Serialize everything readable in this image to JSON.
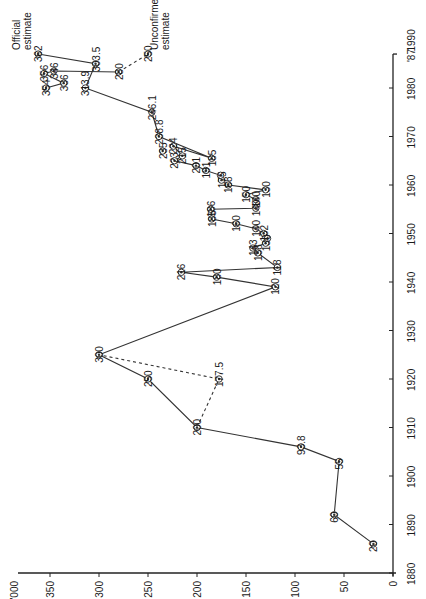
{
  "chart_data": {
    "type": "line",
    "orientation": "rotated-90-ccw",
    "title": "",
    "xlabel": "",
    "ylabel": "'000",
    "x_axis": {
      "min": 1880,
      "max": 1990,
      "ticks": [
        1880,
        1890,
        1900,
        1910,
        1920,
        1930,
        1940,
        1950,
        1960,
        1970,
        1980,
        1990
      ],
      "extra_tick_label": "'87",
      "extra_tick_value": 1987
    },
    "y_axis": {
      "min": 0,
      "max": 370,
      "ticks": [
        0,
        50,
        100,
        150,
        200,
        250,
        300,
        350
      ],
      "unit_label": "'000"
    },
    "grid": false,
    "annotations": [
      {
        "text": "Official estimate",
        "x": 1987,
        "y": 362
      },
      {
        "text": "Unconfirmed estimate",
        "x": 1987,
        "y": 250
      }
    ],
    "series": [
      {
        "name": "Main series",
        "style": "solid",
        "points": [
          {
            "x": 1886,
            "y": 20,
            "label": "20"
          },
          {
            "x": 1892,
            "y": 60,
            "label": "60"
          },
          {
            "x": 1903,
            "y": 55,
            "label": "55"
          },
          {
            "x": 1906,
            "y": 93.8,
            "label": "93.8"
          },
          {
            "x": 1910,
            "y": 200,
            "label": "200"
          },
          {
            "x": 1920,
            "y": 250,
            "label": "250"
          },
          {
            "x": 1925,
            "y": 300,
            "label": "300"
          },
          {
            "x": 1939,
            "y": 120,
            "label": "120"
          },
          {
            "x": 1941,
            "y": 180,
            "label": "180"
          },
          {
            "x": 1942,
            "y": 216,
            "label": "216"
          },
          {
            "x": 1943,
            "y": 118,
            "label": "118"
          },
          {
            "x": 1946,
            "y": 138,
            "label": "138"
          },
          {
            "x": 1947,
            "y": 143,
            "label": "143"
          },
          {
            "x": 1948,
            "y": 130,
            "label": "130"
          },
          {
            "x": 1949,
            "y": 128,
            "label": ""
          },
          {
            "x": 1950,
            "y": 132,
            "label": "132"
          },
          {
            "x": 1951,
            "y": 140,
            "label": "140"
          },
          {
            "x": 1952,
            "y": 160,
            "label": "160"
          },
          {
            "x": 1953,
            "y": 185,
            "label": "185"
          },
          {
            "x": 1955,
            "y": 186,
            "label": "186"
          },
          {
            "x": 1955.2,
            "y": 140,
            "label": "140"
          },
          {
            "x": 1957,
            "y": 140,
            "label": "140"
          },
          {
            "x": 1958,
            "y": 150,
            "label": "150"
          },
          {
            "x": 1959,
            "y": 130,
            "label": "130"
          },
          {
            "x": 1960,
            "y": 168,
            "label": "168"
          },
          {
            "x": 1961,
            "y": 175,
            "label": "175"
          },
          {
            "x": 1962,
            "y": 176,
            "label": ""
          },
          {
            "x": 1963,
            "y": 191,
            "label": "191"
          },
          {
            "x": 1964,
            "y": 201,
            "label": "201"
          },
          {
            "x": 1965,
            "y": 223,
            "label": "223"
          },
          {
            "x": 1966,
            "y": 215,
            "label": "215"
          },
          {
            "x": 1968,
            "y": 224,
            "label": "224"
          },
          {
            "x": 1965.5,
            "y": 185,
            "label": "185"
          },
          {
            "x": 1970,
            "y": 238.8,
            "label": "238.8"
          },
          {
            "x": 1975,
            "y": 246.1,
            "label": "246.1"
          },
          {
            "x": 1980,
            "y": 313.9,
            "label": "313.9"
          },
          {
            "x": 1985,
            "y": 303.5,
            "label": "303.5"
          },
          {
            "x": 1987,
            "y": 362,
            "label": "362"
          }
        ]
      },
      {
        "name": "Early 1980s cluster",
        "style": "solid",
        "points": [
          {
            "x": 1980,
            "y": 354,
            "label": "354"
          },
          {
            "x": 1981,
            "y": 336,
            "label": "336"
          },
          {
            "x": 1983,
            "y": 356,
            "label": "356"
          },
          {
            "x": 1983.5,
            "y": 346,
            "label": "346"
          },
          {
            "x": 1983.3,
            "y": 280,
            "label": "280"
          }
        ]
      },
      {
        "name": "Isolated 1967",
        "style": "marker-only",
        "points": [
          {
            "x": 1967,
            "y": 235,
            "label": "235"
          }
        ]
      },
      {
        "name": "Alternative 1920 estimate",
        "style": "dashed",
        "points": [
          {
            "x": 1910,
            "y": 200,
            "label": ""
          },
          {
            "x": 1920,
            "y": 177.5,
            "label": "177.5"
          },
          {
            "x": 1925,
            "y": 300,
            "label": ""
          }
        ]
      },
      {
        "name": "Unconfirmed estimate",
        "style": "dashed",
        "points": [
          {
            "x": 1983.3,
            "y": 280,
            "label": ""
          },
          {
            "x": 1987,
            "y": 250,
            "label": "250"
          }
        ]
      }
    ]
  }
}
